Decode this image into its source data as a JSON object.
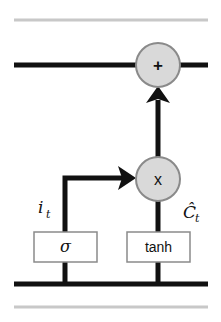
{
  "diagram": {
    "colors": {
      "line": "#111111",
      "guide_line": "#c8c8c8",
      "node_fill": "#d9d9d9",
      "node_stroke": "#8a8a8a",
      "box_stroke": "#8a8a8a",
      "box_fill": "#ffffff"
    },
    "nodes": {
      "add": {
        "symbol": "+"
      },
      "multiply": {
        "symbol": "x"
      }
    },
    "gates": {
      "sigma": {
        "label": "σ"
      },
      "tanh": {
        "label": "tanh"
      }
    },
    "labels": {
      "input_gate": {
        "main": "i",
        "sub": "t"
      },
      "candidate": {
        "main": "Ĉ",
        "sub": "t"
      }
    }
  }
}
